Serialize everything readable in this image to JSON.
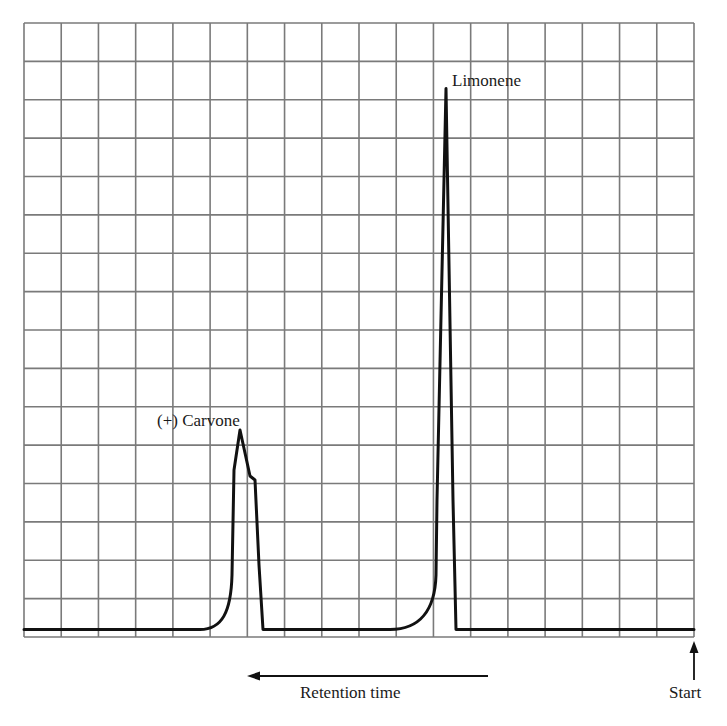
{
  "chart_data": {
    "type": "line",
    "title": "",
    "subtitle": "Gas chromatogram",
    "xlabel": "Retention time",
    "ylabel": "",
    "x_direction": "right-to-left (arrow points left, injection at right)",
    "start_marker": "Start",
    "grid": true,
    "grid_columns": 18,
    "grid_rows": 16,
    "x_units": "grid divisions from Start",
    "y_units": "grid divisions above baseline",
    "ylim": [
      0,
      16
    ],
    "xlim": [
      0,
      18
    ],
    "peaks": [
      {
        "name": "Limonene",
        "label": "Limonene",
        "retention_divisions": 6.6,
        "height_divisions": 14.1,
        "shape": "sharp, narrow, slight tailing on leading (left) side"
      },
      {
        "name": "(+) Carvone",
        "label": "(+) Carvone",
        "retention_divisions": 12.2,
        "height_divisions": 5.2,
        "shape": "broader, with a shoulder on its right side at ~4.0 divisions"
      }
    ],
    "series": [
      {
        "name": "detector response",
        "points": [
          [
            18.0,
            0.0
          ],
          [
            13.2,
            0.0
          ],
          [
            12.7,
            0.7
          ],
          [
            12.5,
            1.5
          ],
          [
            12.4,
            3.5
          ],
          [
            12.2,
            5.2
          ],
          [
            11.9,
            4.1
          ],
          [
            11.8,
            3.9
          ],
          [
            11.6,
            2.5
          ],
          [
            11.5,
            0.0
          ],
          [
            8.0,
            0.0
          ],
          [
            7.3,
            0.3
          ],
          [
            6.9,
            1.0
          ],
          [
            6.8,
            2.5
          ],
          [
            6.7,
            8.0
          ],
          [
            6.6,
            14.1
          ],
          [
            6.5,
            8.0
          ],
          [
            6.2,
            1.0
          ],
          [
            6.2,
            0.0
          ],
          [
            0.0,
            0.0
          ]
        ]
      }
    ]
  },
  "labels": {
    "limonene": "Limonene",
    "carvone": "(+) Carvone",
    "xaxis": "Retention time",
    "start": "Start"
  },
  "colors": {
    "grid": "#7a7a7a",
    "trace": "#111111",
    "text": "#1a1a1a",
    "background": "#ffffff"
  }
}
